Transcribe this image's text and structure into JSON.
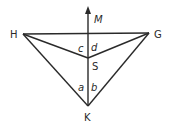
{
  "diagram": {
    "type": "geometry",
    "points": {
      "H": {
        "label": "H",
        "x": 23,
        "y": 34
      },
      "G": {
        "label": "G",
        "x": 149,
        "y": 33
      },
      "S": {
        "label": "S",
        "x": 88,
        "y": 58
      },
      "K": {
        "label": "K",
        "x": 88,
        "y": 106
      },
      "M": {
        "label": "M",
        "x": 88,
        "y": 7
      }
    },
    "segments": [
      [
        "H",
        "G"
      ],
      [
        "H",
        "S"
      ],
      [
        "G",
        "S"
      ],
      [
        "H",
        "K"
      ],
      [
        "G",
        "K"
      ],
      [
        "K",
        "M"
      ]
    ],
    "ray": {
      "from": "K",
      "through": "M",
      "label": "M"
    },
    "angle_labels": {
      "c": "c",
      "d": "d",
      "a": "a",
      "b": "b"
    },
    "colors": {
      "stroke": "#2a2a2a",
      "background": "#ffffff"
    }
  }
}
